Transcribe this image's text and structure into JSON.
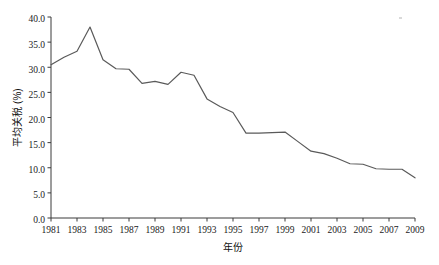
{
  "chart_data": {
    "type": "line",
    "title": "",
    "xlabel": "年份",
    "ylabel": "平均关税 (%)",
    "xlim": [
      1981,
      2009
    ],
    "ylim": [
      0.0,
      40.0
    ],
    "grid": false,
    "legend": null,
    "y_ticks": [
      "0.0",
      "5.0",
      "10.0",
      "15.0",
      "20.0",
      "25.0",
      "30.0",
      "35.0",
      "40.0"
    ],
    "y_tick_values": [
      0.0,
      5.0,
      10.0,
      15.0,
      20.0,
      25.0,
      30.0,
      35.0,
      40.0
    ],
    "x_ticks": [
      "1981",
      "1983",
      "1985",
      "1987",
      "1989",
      "1991",
      "1993",
      "1995",
      "1997",
      "1999",
      "2001",
      "2003",
      "2005",
      "2007",
      "2009"
    ],
    "x_tick_values": [
      1981,
      1983,
      1985,
      1987,
      1989,
      1991,
      1993,
      1995,
      1997,
      1999,
      2001,
      2003,
      2005,
      2007,
      2009
    ],
    "series": [
      {
        "name": "平均关税",
        "color": "#5a5a5a",
        "x": [
          1981,
          1982,
          1983,
          1984,
          1985,
          1986,
          1987,
          1988,
          1989,
          1990,
          1991,
          1992,
          1993,
          1994,
          1995,
          1996,
          1997,
          1998,
          1999,
          2000,
          2001,
          2002,
          2003,
          2004,
          2005,
          2006,
          2007,
          2008,
          2009
        ],
        "values": [
          30.5,
          32.0,
          33.2,
          38.0,
          31.5,
          29.7,
          29.6,
          26.8,
          27.2,
          26.6,
          29.0,
          28.4,
          23.7,
          22.2,
          21.0,
          16.9,
          16.9,
          17.0,
          17.1,
          15.2,
          13.3,
          12.8,
          11.9,
          10.8,
          10.7,
          9.8,
          9.7,
          9.7,
          8.0
        ]
      }
    ]
  },
  "plot": {
    "left": 51,
    "right": 415,
    "top": 17,
    "bottom": 218
  }
}
